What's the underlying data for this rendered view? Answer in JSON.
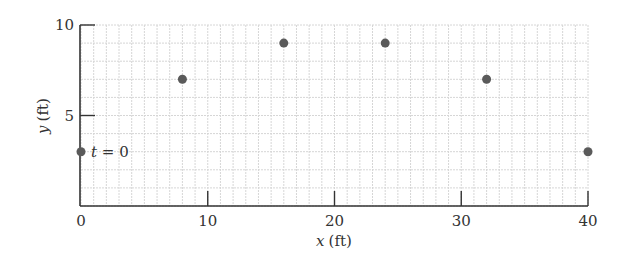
{
  "chart_data": {
    "type": "scatter",
    "title": "",
    "xlabel_var": "x",
    "xlabel_unit": "(ft)",
    "ylabel_var": "y",
    "ylabel_unit": "(ft)",
    "xlim": [
      0,
      40
    ],
    "ylim": [
      0,
      10
    ],
    "x_ticks": [
      0,
      10,
      20,
      30,
      40
    ],
    "y_ticks": [
      5,
      10
    ],
    "grid": true,
    "grid_minor_step_x": 1,
    "grid_minor_step_y": 1,
    "series": [
      {
        "name": "position",
        "x": [
          0,
          8,
          16,
          24,
          32,
          40
        ],
        "y": [
          3,
          7,
          9,
          9,
          7,
          3
        ]
      }
    ],
    "annotations": [
      {
        "text_var": "t",
        "text_rest": " = 0",
        "x": 0,
        "y": 3
      }
    ],
    "colors": {
      "point": "#5a5a5a",
      "axis": "#333333",
      "grid": "#d6d6d6"
    }
  }
}
